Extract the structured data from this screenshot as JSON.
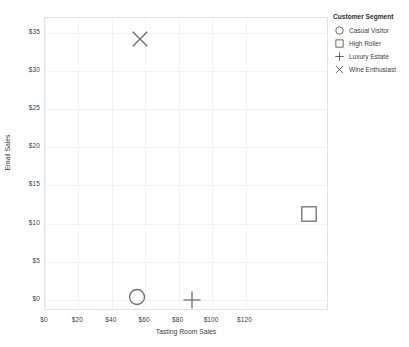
{
  "chart_data": {
    "type": "scatter",
    "title": "",
    "xlabel": "Tasting Room Sales",
    "ylabel": "Email Sales",
    "xlim": [
      0,
      170
    ],
    "ylim": [
      -1.5,
      37
    ],
    "grid": true,
    "legend_position": "right",
    "legend_title": "Customer Segment",
    "xticks": [
      "$0",
      "$20",
      "$40",
      "$60",
      "$80",
      "$100",
      "$120"
    ],
    "xtick_values": [
      0,
      20,
      40,
      60,
      80,
      100,
      120
    ],
    "yticks": [
      "$0",
      "$5",
      "$10",
      "$15",
      "$20",
      "$25",
      "$30",
      "$35"
    ],
    "ytick_values": [
      0,
      5,
      10,
      15,
      20,
      25,
      30,
      35
    ],
    "series": [
      {
        "name": "Casual Visitor",
        "marker": "circle",
        "x": 55,
        "y": 0.4
      },
      {
        "name": "High Roller",
        "marker": "square",
        "x": 158,
        "y": 11.3
      },
      {
        "name": "Luxury Estate",
        "marker": "plus",
        "x": 88,
        "y": 0.0
      },
      {
        "name": "Wine Enthusiast",
        "marker": "cross",
        "x": 57,
        "y": 34.2
      }
    ]
  },
  "legend": {
    "title": "Customer Segment",
    "items": [
      {
        "label": "Casual Visitor",
        "marker": "circle-icon"
      },
      {
        "label": "High Roller",
        "marker": "square-icon"
      },
      {
        "label": "Luxury Estate",
        "marker": "plus-icon"
      },
      {
        "label": "Wine Enthusiast",
        "marker": "cross-icon"
      }
    ]
  },
  "axes": {
    "x_title": "Tasting Room Sales",
    "y_title": "Email Sales"
  }
}
